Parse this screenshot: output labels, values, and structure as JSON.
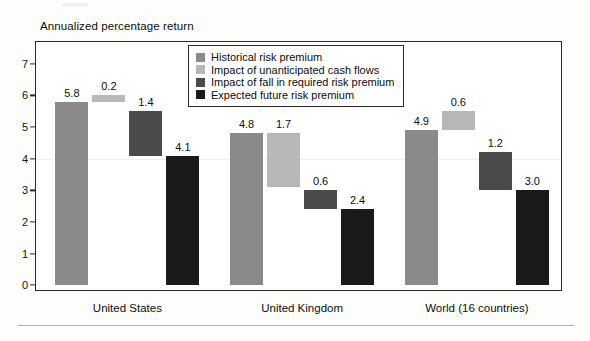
{
  "chart_data": {
    "type": "bar",
    "subtype": "waterfall-grouped",
    "title": "Annualized percentage return",
    "xlabel": "",
    "ylabel": "",
    "ylim": [
      0,
      7.5
    ],
    "yticks": [
      0,
      1,
      2,
      3,
      4,
      5,
      6,
      7
    ],
    "ytick_labels": [
      "0",
      "1",
      "2",
      "3",
      "4",
      "5",
      "6",
      "7"
    ],
    "grid": false,
    "legend_position": "top-center-inside",
    "categories": [
      "United States",
      "United Kingdom",
      "World (16 countries)"
    ],
    "series": [
      {
        "name": "Historical risk premium",
        "color": "#8a8a8a",
        "values": [
          5.8,
          4.8,
          4.9
        ],
        "bases": [
          0,
          0,
          0
        ],
        "labels": [
          "5.8",
          "4.8",
          "4.9"
        ]
      },
      {
        "name": "Impact of unanticipated cash flows",
        "color": "#b8b8b8",
        "values": [
          0.2,
          1.7,
          0.6
        ],
        "bases": [
          5.8,
          3.1,
          4.9
        ],
        "labels": [
          "0.2",
          "1.7",
          "0.6"
        ]
      },
      {
        "name": "Impact of fall in required risk premium",
        "color": "#4a4a4a",
        "values": [
          1.4,
          0.6,
          1.2
        ],
        "bases": [
          4.1,
          2.4,
          3.0
        ],
        "labels": [
          "1.4",
          "0.6",
          "1.2"
        ]
      },
      {
        "name": "Expected future risk premium",
        "color": "#1a1a1a",
        "values": [
          4.1,
          2.4,
          3.0
        ],
        "bases": [
          0,
          0,
          0
        ],
        "labels": [
          "4.1",
          "2.4",
          "3.0"
        ]
      }
    ]
  },
  "legend": {
    "items": [
      {
        "label": "Historical risk premium",
        "color": "#8a8a8a"
      },
      {
        "label": "Impact of unanticipated cash flows",
        "color": "#b8b8b8"
      },
      {
        "label": "Impact of fall in required risk premium",
        "color": "#4a4a4a"
      },
      {
        "label": "Expected future risk premium",
        "color": "#1a1a1a"
      }
    ]
  },
  "colors": {
    "frame": "#2a2a2a",
    "page_background": "#fdfdfb",
    "plot_background": "#ffffff",
    "rule": "#b4b4b4"
  }
}
